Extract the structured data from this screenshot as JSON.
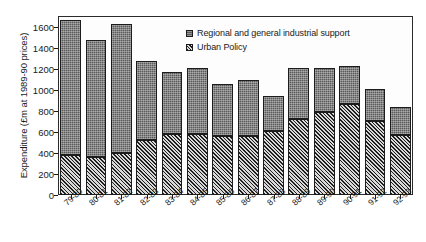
{
  "chart_data": {
    "type": "bar",
    "stacked": true,
    "title": "",
    "subtitle": "",
    "xlabel": "",
    "ylabel": "Expenditure (£m at 1989-90 prices)",
    "ylim": [
      0,
      1700
    ],
    "yticks": [
      0,
      200,
      400,
      600,
      800,
      1000,
      1200,
      1400,
      1600
    ],
    "ytick_labels": [
      "0",
      "200",
      "400",
      "600",
      "800",
      "1000",
      "1200",
      "1400",
      "1600"
    ],
    "grid": false,
    "legend_position": "top-center",
    "categories": [
      "79-80",
      "80-81",
      "81-82",
      "82-83",
      "83-84",
      "84-85",
      "85-86",
      "86-87",
      "87-88",
      "88-89",
      "89-90",
      "90-91",
      "91-92",
      "92-93"
    ],
    "series": [
      {
        "name": "Urban Policy",
        "values": [
          380,
          360,
          400,
          525,
          580,
          580,
          560,
          565,
          610,
          720,
          790,
          860,
          700,
          570
        ],
        "color": "#6d6d6d",
        "fill": "diagonal-hatch"
      },
      {
        "name": "Regional and general industrial support",
        "values": [
          1285,
          1115,
          1220,
          750,
          585,
          630,
          495,
          525,
          330,
          485,
          415,
          365,
          310,
          265
        ],
        "color": "#5a5a5a",
        "fill": "stipple"
      }
    ],
    "totals": [
      1665,
      1475,
      1620,
      1275,
      1165,
      1210,
      1055,
      1090,
      940,
      1205,
      1205,
      1225,
      1010,
      835
    ]
  },
  "legend": {
    "entries": [
      {
        "label": "Regional and general industrial support",
        "swatch": "stipple-swatch"
      },
      {
        "label": "Urban Policy",
        "swatch": "hatch-swatch"
      }
    ]
  },
  "axes": {
    "y_title": "Expenditure (£m at 1989-90 prices)"
  }
}
